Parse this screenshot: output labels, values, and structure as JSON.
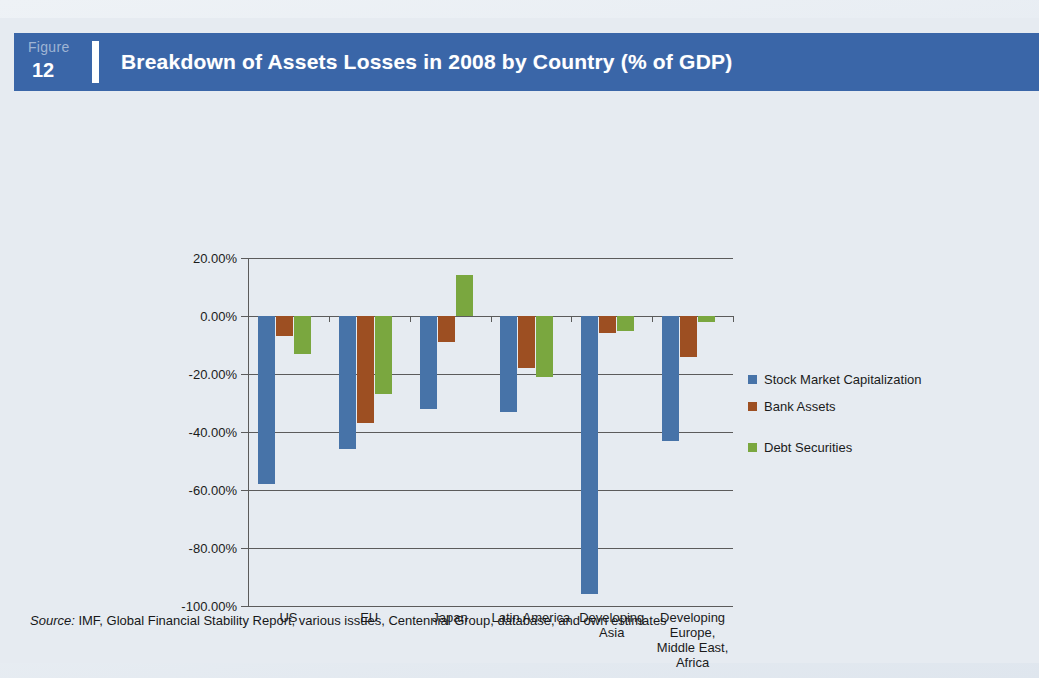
{
  "figure": {
    "word": "Figure",
    "number": "12",
    "title": "Breakdown of Assets Losses in 2008 by Country (% of GDP)"
  },
  "colors": {
    "banner": "#3a66a8",
    "series_blue": "#4773a8",
    "series_brown": "#9d4f22",
    "series_green": "#7aa73f",
    "page_background": "#e6ebf1",
    "axis": "#5b5b5b"
  },
  "source": {
    "label": "Source:",
    "text": " IMF, Global Financial Stability Report, various issues, Centennial Group, database, and own estimates"
  },
  "legend": {
    "position": "right",
    "items": [
      {
        "name": "Stock Market Capitalization",
        "color": "#4773a8"
      },
      {
        "name": "Bank Assets",
        "color": "#9d4f22"
      },
      {
        "name": "Debt Securities",
        "color": "#7aa73f"
      }
    ]
  },
  "chart_data": {
    "type": "bar",
    "title": "Breakdown of Assets Losses in 2008 by Country (% of GDP)",
    "xlabel": "",
    "ylabel": "",
    "ylim": [
      -100,
      20
    ],
    "ytick_values": [
      20,
      0,
      -20,
      -40,
      -60,
      -80,
      -100
    ],
    "ytick_labels": [
      "20.00%",
      "0.00%",
      "-20.00%",
      "-40.00%",
      "-60.00%",
      "-80.00%",
      "-100.00%"
    ],
    "grid": true,
    "categories": [
      "US",
      "EU",
      "Japan",
      "Latin America",
      "Developing Asia",
      "Developing Europe, Middle East, Africa"
    ],
    "category_label_lines": [
      [
        "US"
      ],
      [
        "EU"
      ],
      [
        "Japan"
      ],
      [
        "Latin America"
      ],
      [
        "Developing",
        "Asia"
      ],
      [
        "Developing",
        "Europe,",
        "Middle East,",
        "Africa"
      ]
    ],
    "series": [
      {
        "name": "Stock Market Capitalization",
        "color": "#4773a8",
        "values": [
          -58.0,
          -46.0,
          -32.0,
          -33.0,
          -96.0,
          -43.0
        ]
      },
      {
        "name": "Bank Assets",
        "color": "#9d4f22",
        "values": [
          -7.0,
          -37.0,
          -9.0,
          -18.0,
          -6.0,
          -14.0
        ]
      },
      {
        "name": "Debt Securities",
        "color": "#7aa73f",
        "values": [
          -13.0,
          -27.0,
          14.0,
          -21.0,
          -5.0,
          -2.0
        ]
      }
    ]
  }
}
